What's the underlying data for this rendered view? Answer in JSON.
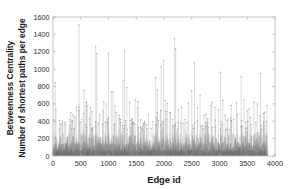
{
  "chart_data": {
    "type": "bar",
    "title": "",
    "subtitle": "",
    "xlabel": "Edge id",
    "ylabel_line1": "Betweenness Centrality",
    "ylabel_line2": "Number of shortest paths per edge",
    "xlim": [
      0,
      4000
    ],
    "ylim": [
      0,
      1600
    ],
    "xticks": [
      0,
      500,
      1000,
      1500,
      2000,
      2500,
      3000,
      3500,
      4000
    ],
    "yticks": [
      0,
      200,
      400,
      600,
      800,
      1000,
      1200,
      1400,
      1600
    ],
    "xtick_labels": [
      "0",
      "500",
      "1000",
      "1500",
      "2000",
      "2500",
      "3000",
      "3500",
      "4000"
    ],
    "ytick_labels": [
      "0",
      "200",
      "400",
      "600",
      "800",
      "1000",
      "1200",
      "1400",
      "1600"
    ],
    "grid": false,
    "legend": null,
    "plot_style": "stem",
    "stem_color": "#9a9a9a",
    "marker_color": "#8c8c8c",
    "axis_color": "#b9b9b9",
    "data_x_max": 3860,
    "n_points": 3860,
    "baseline": 0,
    "median_value": 60,
    "typical_bulk_max": 260,
    "notable_peaks": [
      {
        "x": 40,
        "y": 845
      },
      {
        "x": 55,
        "y": 530
      },
      {
        "x": 120,
        "y": 410
      },
      {
        "x": 175,
        "y": 380
      },
      {
        "x": 300,
        "y": 350
      },
      {
        "x": 360,
        "y": 470
      },
      {
        "x": 420,
        "y": 560
      },
      {
        "x": 470,
        "y": 1510
      },
      {
        "x": 520,
        "y": 420
      },
      {
        "x": 560,
        "y": 755
      },
      {
        "x": 600,
        "y": 620
      },
      {
        "x": 660,
        "y": 430
      },
      {
        "x": 700,
        "y": 510
      },
      {
        "x": 770,
        "y": 1260
      },
      {
        "x": 790,
        "y": 1180
      },
      {
        "x": 840,
        "y": 470
      },
      {
        "x": 900,
        "y": 520
      },
      {
        "x": 960,
        "y": 600
      },
      {
        "x": 1000,
        "y": 1185
      },
      {
        "x": 1050,
        "y": 740
      },
      {
        "x": 1080,
        "y": 745
      },
      {
        "x": 1140,
        "y": 500
      },
      {
        "x": 1190,
        "y": 470
      },
      {
        "x": 1260,
        "y": 865
      },
      {
        "x": 1290,
        "y": 1210
      },
      {
        "x": 1330,
        "y": 790
      },
      {
        "x": 1380,
        "y": 620
      },
      {
        "x": 1430,
        "y": 430
      },
      {
        "x": 1480,
        "y": 645
      },
      {
        "x": 1530,
        "y": 625
      },
      {
        "x": 1580,
        "y": 420
      },
      {
        "x": 1650,
        "y": 400
      },
      {
        "x": 1720,
        "y": 470
      },
      {
        "x": 1800,
        "y": 400
      },
      {
        "x": 1850,
        "y": 900
      },
      {
        "x": 1880,
        "y": 760
      },
      {
        "x": 1950,
        "y": 1030
      },
      {
        "x": 1990,
        "y": 1100
      },
      {
        "x": 2020,
        "y": 640
      },
      {
        "x": 2060,
        "y": 610
      },
      {
        "x": 2120,
        "y": 495
      },
      {
        "x": 2190,
        "y": 1355
      },
      {
        "x": 2210,
        "y": 1235
      },
      {
        "x": 2260,
        "y": 540
      },
      {
        "x": 2320,
        "y": 560
      },
      {
        "x": 2380,
        "y": 420
      },
      {
        "x": 2440,
        "y": 610
      },
      {
        "x": 2500,
        "y": 750
      },
      {
        "x": 2550,
        "y": 1075
      },
      {
        "x": 2600,
        "y": 560
      },
      {
        "x": 2650,
        "y": 700
      },
      {
        "x": 2720,
        "y": 470
      },
      {
        "x": 2790,
        "y": 430
      },
      {
        "x": 2860,
        "y": 620
      },
      {
        "x": 2920,
        "y": 560
      },
      {
        "x": 2980,
        "y": 530
      },
      {
        "x": 3020,
        "y": 965
      },
      {
        "x": 3060,
        "y": 640
      },
      {
        "x": 3100,
        "y": 470
      },
      {
        "x": 3140,
        "y": 410
      },
      {
        "x": 3200,
        "y": 440
      },
      {
        "x": 3260,
        "y": 425
      },
      {
        "x": 3320,
        "y": 480
      },
      {
        "x": 3390,
        "y": 915
      },
      {
        "x": 3440,
        "y": 650
      },
      {
        "x": 3500,
        "y": 520
      },
      {
        "x": 3560,
        "y": 445
      },
      {
        "x": 3620,
        "y": 620
      },
      {
        "x": 3680,
        "y": 600
      },
      {
        "x": 3740,
        "y": 950
      },
      {
        "x": 3790,
        "y": 490
      },
      {
        "x": 3840,
        "y": 400
      }
    ]
  }
}
